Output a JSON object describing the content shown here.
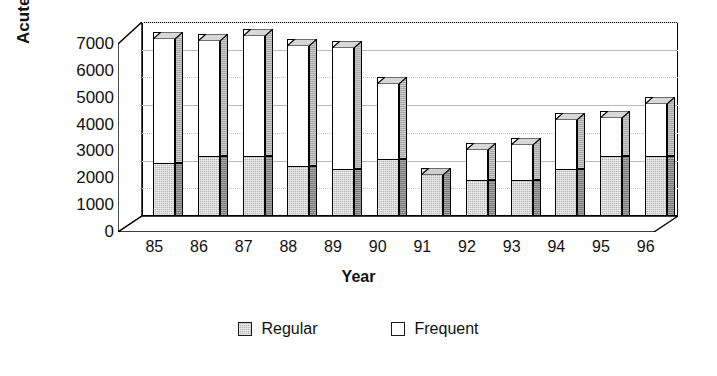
{
  "chart_data": {
    "type": "bar",
    "stacked": true,
    "title": "",
    "xlabel": "Year",
    "ylabel": "Acute Visits",
    "categories": [
      "85",
      "86",
      "87",
      "88",
      "89",
      "90",
      "91",
      "92",
      "93",
      "94",
      "95",
      "96"
    ],
    "ylim": [
      0,
      7000
    ],
    "yticks": [
      0,
      1000,
      2000,
      3000,
      4000,
      5000,
      6000,
      7000
    ],
    "ytick_labels": [
      "0",
      "1000",
      "2000",
      "3000",
      "4000",
      "5000",
      "6000",
      "7000"
    ],
    "grid": true,
    "legend_position": "bottom",
    "series": [
      {
        "name": "Regular",
        "color": "#b9b9b9",
        "values": [
          1900,
          2150,
          2150,
          1800,
          1700,
          2050,
          1750,
          1300,
          1300,
          1700,
          2150,
          2150
        ]
      },
      {
        "name": "Frequent",
        "color": "#ffffff",
        "values": [
          4750,
          4400,
          4600,
          4600,
          4600,
          2950,
          0,
          1350,
          1500,
          2000,
          1650,
          2150
        ]
      }
    ],
    "totals": [
      6650,
      6550,
      6750,
      6400,
      6300,
      5000,
      1750,
      2650,
      2800,
      3700,
      3800,
      4300
    ]
  },
  "axes": {
    "y_title": "Acute Visits",
    "x_title": "Year"
  },
  "legend": {
    "items": [
      {
        "label": "Regular",
        "swatch": "gray-swatch"
      },
      {
        "label": "Frequent",
        "swatch": "white-swatch"
      }
    ]
  }
}
